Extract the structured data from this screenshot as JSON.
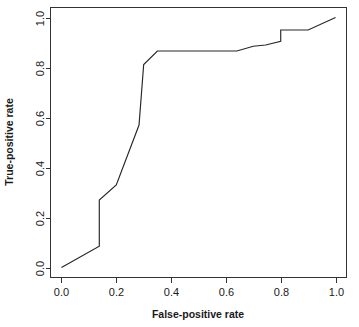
{
  "chart_data": {
    "type": "line",
    "title": "",
    "subtitle": "",
    "xlabel": "False-positive rate",
    "ylabel": "True-positive rate",
    "xlim": [
      -0.04,
      1.04
    ],
    "ylim": [
      -0.04,
      1.04
    ],
    "grid": false,
    "legend": null,
    "x_ticks": [
      0.0,
      0.2,
      0.4,
      0.6,
      0.8,
      1.0
    ],
    "x_tick_labels": [
      "0.0",
      "0.2",
      "0.4",
      "0.6",
      "0.8",
      "1.0"
    ],
    "y_ticks": [
      0.0,
      0.2,
      0.4,
      0.6,
      0.8,
      1.0
    ],
    "y_tick_labels": [
      "0.0",
      "0.2",
      "0.4",
      "0.6",
      "0.8",
      "1.0"
    ],
    "line_color": "#262626",
    "axis_color": "#333333",
    "background_color": "#ffffff",
    "series": [
      {
        "name": "ROC curve",
        "x": [
          0.0,
          0.138,
          0.138,
          0.2,
          0.283,
          0.283,
          0.3,
          0.35,
          0.64,
          0.7,
          0.745,
          0.8,
          0.8,
          0.9,
          1.0
        ],
        "y": [
          0.0,
          0.085,
          0.27,
          0.33,
          0.57,
          0.57,
          0.812,
          0.866,
          0.866,
          0.885,
          0.89,
          0.905,
          0.95,
          0.95,
          1.0
        ]
      }
    ]
  },
  "axes": {
    "x_title": "False-positive rate",
    "y_title": "True-positive rate"
  }
}
